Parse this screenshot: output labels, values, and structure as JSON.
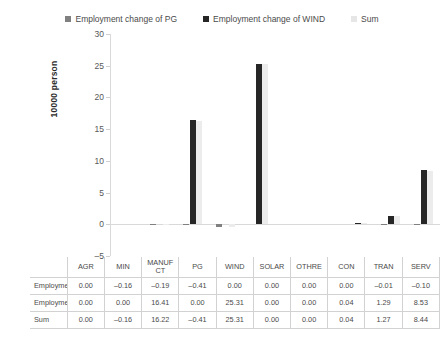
{
  "chart_data": {
    "type": "bar",
    "title": "",
    "xlabel": "",
    "ylabel": "10000 person",
    "ylim": [
      -5,
      30
    ],
    "yticks": [
      -5,
      0,
      5,
      10,
      15,
      20,
      25,
      30
    ],
    "grid": false,
    "legend_position": "top-center",
    "categories": [
      "AGR",
      "MIN",
      "MANUFCT",
      "PG",
      "WIND",
      "SOLAR",
      "OTHRE",
      "CON",
      "TRAN",
      "SERV"
    ],
    "category_display": [
      "AGR",
      "MIN",
      "MANUF CT",
      "PG",
      "WIND",
      "SOLAR",
      "OTHRE",
      "CON",
      "TRAN",
      "SERV"
    ],
    "series": [
      {
        "name": "Employment change of PG",
        "color": "#808080",
        "values": [
          0.0,
          -0.16,
          -0.19,
          -0.41,
          0.0,
          0.0,
          0.0,
          0.0,
          -0.01,
          -0.1
        ],
        "labels": [
          "0.00",
          "-0.16",
          "-0.19",
          "-0.41",
          "0.00",
          "0.00",
          "0.00",
          "0.00",
          "-0.01",
          "-0.10"
        ]
      },
      {
        "name": "Employment change of WIND",
        "color": "#262626",
        "values": [
          0.0,
          0.0,
          16.41,
          0.0,
          25.31,
          0.0,
          0.0,
          0.04,
          1.29,
          8.53
        ],
        "labels": [
          "0.00",
          "0.00",
          "16.41",
          "0.00",
          "25.31",
          "0.00",
          "0.00",
          "0.04",
          "1.29",
          "8.53"
        ]
      },
      {
        "name": "Sum",
        "color": "#ececec",
        "values": [
          0.0,
          -0.16,
          16.22,
          -0.41,
          25.31,
          0.0,
          0.0,
          0.04,
          1.27,
          8.44
        ],
        "labels": [
          "0.00",
          "-0.16",
          "16.22",
          "-0.41",
          "25.31",
          "0.00",
          "0.00",
          "0.04",
          "1.27",
          "8.44"
        ]
      }
    ]
  },
  "legend": {
    "items": [
      {
        "label": "Employment change of PG",
        "color": "#808080"
      },
      {
        "label": "Employment change of WIND",
        "color": "#262626"
      },
      {
        "label": "Sum",
        "color": "#e6e6e6"
      }
    ]
  },
  "table": {
    "corner_label": "",
    "column_headers": [
      "AGR",
      "MIN",
      "MANUF CT",
      "PG",
      "WIND",
      "SOLAR",
      "OTHRE",
      "CON",
      "TRAN",
      "SERV"
    ],
    "rows": [
      {
        "label": "Employment change of PG",
        "cells": [
          "0.00",
          "-0.16",
          "-0.19",
          "-0.41",
          "0.00",
          "0.00",
          "0.00",
          "0.00",
          "-0.01",
          "-0.10"
        ]
      },
      {
        "label": "Employment change of WIND",
        "cells": [
          "0.00",
          "0.00",
          "16.41",
          "0.00",
          "25.31",
          "0.00",
          "0.00",
          "0.04",
          "1.29",
          "8.53"
        ]
      },
      {
        "label": "Sum",
        "cells": [
          "0.00",
          "-0.16",
          "16.22",
          "-0.41",
          "25.31",
          "0.00",
          "0.00",
          "0.04",
          "1.27",
          "8.44"
        ]
      }
    ]
  },
  "axis": {
    "y_title": "10000 person",
    "y_ticks": [
      "30",
      "25",
      "20",
      "15",
      "10",
      "5",
      "0",
      "-5"
    ]
  }
}
